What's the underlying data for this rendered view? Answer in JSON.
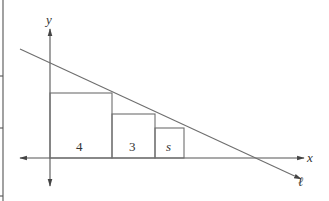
{
  "diagram": {
    "type": "geometry-figure",
    "axes": {
      "x_label": "x",
      "y_label": "y"
    },
    "line_label": "ℓ",
    "squares": [
      {
        "label": "4",
        "side": 4
      },
      {
        "label": "3",
        "side": 3
      },
      {
        "label": "s",
        "side": "s"
      }
    ],
    "colors": {
      "line": "#6e6e6e",
      "axis": "#555555",
      "text": "#333333"
    }
  }
}
